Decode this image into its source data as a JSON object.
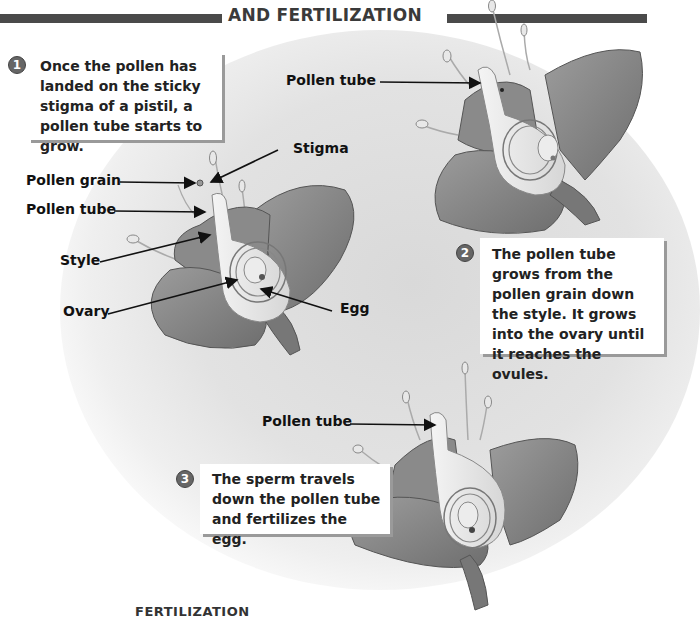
{
  "header": {
    "title": "AND FERTILIZATION"
  },
  "steps": [
    {
      "number": "1",
      "text": "Once the pollen has landed on the sticky stigma of a pistil, a pollen tube starts to grow."
    },
    {
      "number": "2",
      "text": "The pollen tube grows from the pollen grain down the style. It grows into the ovary until it reaches the ovules."
    },
    {
      "number": "3",
      "text": "The sperm travels down the pollen tube and fertilizes the egg."
    }
  ],
  "diagram1": {
    "labels": {
      "stigma": "Stigma",
      "pollen_grain": "Pollen grain",
      "pollen_tube": "Pollen tube",
      "style": "Style",
      "ovary": "Ovary",
      "egg": "Egg"
    }
  },
  "diagram2": {
    "labels": {
      "pollen_tube": "Pollen tube"
    }
  },
  "diagram3": {
    "labels": {
      "pollen_tube": "Pollen tube"
    }
  },
  "footer": {
    "partial_heading": "FERTILIZATION"
  },
  "colors": {
    "header_bar": "#4a4a4a",
    "petal": "#8a8a8a",
    "background_glow": "#dcdcdc",
    "callout_shadow": "#9a9a9a"
  }
}
